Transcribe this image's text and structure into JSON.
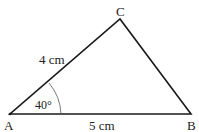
{
  "diagram": {
    "type": "triangle",
    "vertices": {
      "A": {
        "label": "A",
        "x": 10,
        "y": 114
      },
      "B": {
        "label": "B",
        "x": 191,
        "y": 114
      },
      "C": {
        "label": "C",
        "x": 120,
        "y": 19
      }
    },
    "sides": {
      "AC": {
        "label": "4 cm"
      },
      "AB": {
        "label": "5 cm"
      }
    },
    "angle": {
      "vertex": "A",
      "label": "40°"
    },
    "colors": {
      "line": "#1a1a1a",
      "arc": "#555555",
      "text": "#222222"
    }
  }
}
